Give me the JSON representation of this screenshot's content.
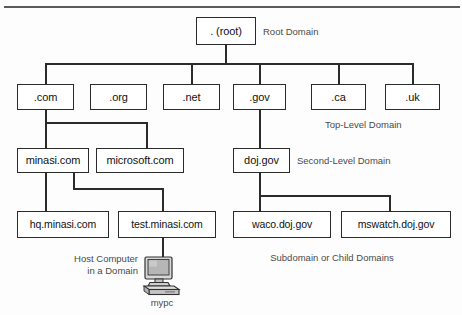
{
  "diagram": {
    "line_color": "#2b2b2b",
    "box_fill": "#ffffff",
    "caption_color": "#4a4a4a",
    "background": "#fdfdfd"
  },
  "nodes": {
    "root": {
      "label": ". (root)"
    },
    "tld": [
      {
        "label": ".com"
      },
      {
        "label": ".org"
      },
      {
        "label": ".net"
      },
      {
        "label": ".gov"
      },
      {
        "label": ".ca"
      },
      {
        "label": ".uk"
      }
    ],
    "second_level": [
      {
        "label": "minasi.com"
      },
      {
        "label": "microsoft.com"
      },
      {
        "label": "doj.gov"
      }
    ],
    "subdomains": [
      {
        "label": "hq.minasi.com"
      },
      {
        "label": "test.minasi.com"
      },
      {
        "label": "waco.doj.gov"
      },
      {
        "label": "mswatch.doj.gov"
      }
    ]
  },
  "captions": {
    "root_domain": "Root Domain",
    "top_level_domain": "Top-Level Domain",
    "second_level_domain": "Second-Level Domain",
    "host_computer_line1": "Host Computer",
    "host_computer_line2": "in a Domain",
    "subdomain_or_child": "Subdomain or Child Domains",
    "computer_name": "mypc"
  }
}
